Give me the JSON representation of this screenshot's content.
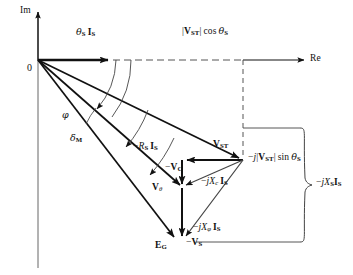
{
  "figure": {
    "type": "phasor-diagram",
    "background_color": "#ffffff",
    "line_color": "#111111",
    "thin_line_color": "#444444"
  },
  "axes": {
    "imaginary_label": "Im",
    "real_label": "Re",
    "origin_label": "0"
  },
  "angles": [
    {
      "name": "theta-s",
      "symbol": "θ",
      "subscript": "S",
      "label": "φ"
    },
    {
      "name": "phi",
      "symbol": "φ",
      "subscript": "",
      "label": "φ"
    },
    {
      "name": "delta-m",
      "symbol": "δ",
      "subscript": "M",
      "label": "δ"
    }
  ],
  "labels": {
    "current_theta": {
      "greek": "θ",
      "sub1": "S",
      "vec": "I",
      "sub2": "S"
    },
    "vst_cos": {
      "pre": "|",
      "vec": "V",
      "sub": "ST",
      "post": "| cos ",
      "greek": "θ",
      "sub2": "S"
    },
    "vst": {
      "vec": "V",
      "sub": "ST"
    },
    "vst_sin": {
      "pre": "−",
      "j": "j",
      "bar": "|",
      "vec": "V",
      "sub": "ST",
      "post": "| sin ",
      "greek": "θ",
      "sub2": "S"
    },
    "rs_is": {
      "pre": "−",
      "R": "R",
      "subR": "S",
      "vec": "I",
      "subI": "S"
    },
    "minus_vc": {
      "pre": "−",
      "vec": "V",
      "sub": "C"
    },
    "v_theta": {
      "vec": "V",
      "sub": "θ"
    },
    "jxc_is": {
      "pre": "−",
      "j": "j",
      "X": "X",
      "subX": "c",
      "vec": "I",
      "subI": "S"
    },
    "jxphi_is": {
      "pre": "−",
      "j": "j",
      "X": "X",
      "subX": "φ",
      "vec": "I",
      "subI": "S"
    },
    "eg": {
      "vec": "E",
      "sub": "G"
    },
    "minus_vs": {
      "pre": "−",
      "vec": "V",
      "sub": "S"
    },
    "jxs_is": {
      "pre": "−",
      "j": "j",
      "X": "X",
      "subX": "S",
      "vec": "I",
      "subI": "S"
    },
    "phi_angle": {
      "greek": "φ"
    },
    "delta_angle": {
      "greek": "δ",
      "sub": "M"
    }
  },
  "text_plain": {
    "im": "Im",
    "re": "Re",
    "origin": "0",
    "theta_s_i_s": "θS IS",
    "vst_cos_theta": "|VST| cos θS",
    "vst": "VST",
    "minus_j_vst_sin_theta": "−j|VST| sin θS",
    "minus_rs_is": "−RS IS",
    "minus_vc": "−VC",
    "v_theta": "Vθ",
    "minus_jxc_is": "−jXc IS",
    "minus_jxphi_is": "−jXφ IS",
    "eg": "EG",
    "minus_vs": "−VS",
    "minus_jxs_is": "−jXS IS",
    "phi": "φ",
    "delta_m": "δM"
  },
  "geometry": {
    "origin": [
      38,
      60
    ],
    "im_axis_top": [
      38,
      8
    ],
    "re_axis_end": [
      310,
      60
    ],
    "is_tip": [
      113,
      60
    ],
    "vst_point": [
      243,
      160
    ],
    "v_theta_point": [
      182,
      188
    ],
    "eg_point": [
      182,
      240
    ],
    "eg_tip_left": [
      170,
      240
    ],
    "vc_corner_left": [
      182,
      160
    ],
    "dashed_corner": [
      243,
      60
    ],
    "brace_x": 312,
    "brace_top": 128,
    "brace_bottom": 242
  }
}
